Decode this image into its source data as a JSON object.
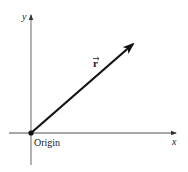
{
  "diagram": {
    "type": "position-vector",
    "labels": {
      "y_axis": "y",
      "x_axis": "x",
      "vector": "r",
      "origin": "Origin"
    },
    "colors": {
      "axis": "#8a8a8a",
      "vector": "#111111",
      "text": "#222222",
      "background": "#ffffff"
    },
    "geometry": {
      "origin": [
        31,
        133
      ],
      "vector_tip": [
        134,
        43
      ],
      "x_axis_range": [
        9,
        177
      ],
      "y_axis_range": [
        14,
        165
      ]
    }
  }
}
